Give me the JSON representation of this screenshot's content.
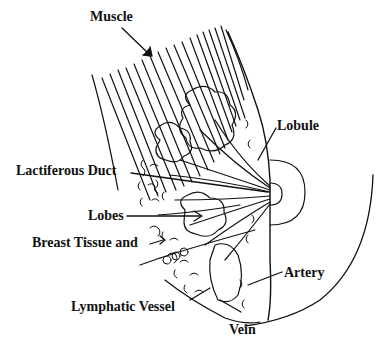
{
  "diagram": {
    "labels": {
      "muscle": "Muscle",
      "lobule": "Lobule",
      "lactiferous_duct": "Lactiferous Duct",
      "lobes": "Lobes",
      "breast_tissue_line1": "Breast Tissue and",
      "breast_tissue_line2": "Fat Cells",
      "artery": "Artery",
      "lymphatic_vessel": "Lymphatic Vessel",
      "vein": "Vein"
    },
    "colors": {
      "ink": "#111111",
      "background": "#ffffff"
    }
  }
}
